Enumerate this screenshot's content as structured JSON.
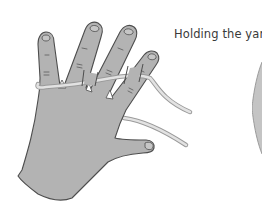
{
  "caption": {
    "text": "Holding the yarn"
  },
  "figures": [
    {
      "name": "hand-holding-yarn-illustration",
      "description": "Left hand, palm facing away, fingers spread, yarn wrapped around little finger and woven over/under fingers, trailing off to the right"
    },
    {
      "name": "partial-illustration-right-edge",
      "description": "Partially visible gray rounded shape cut off at the right edge"
    }
  ],
  "colors": {
    "hand_fill": "#b3b3b3",
    "hand_outline": "#4d4d4d",
    "yarn_fill": "#dcdcdc",
    "yarn_edge": "#9a9a9a",
    "caption_text": "#3a3a3a",
    "background": "#ffffff"
  }
}
